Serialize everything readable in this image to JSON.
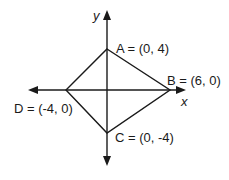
{
  "diagram": {
    "type": "coordinate-plane-quadrilateral",
    "axes": {
      "x_label": "x",
      "y_label": "y"
    },
    "vertices": [
      {
        "name": "A",
        "label": "A = (0, 4)",
        "x": 0,
        "y": 4
      },
      {
        "name": "B",
        "label": "B = (6, 0)",
        "x": 6,
        "y": 0
      },
      {
        "name": "C",
        "label": "C = (0, -4)",
        "x": 0,
        "y": -4
      },
      {
        "name": "D",
        "label": "D = (-4, 0)",
        "x": -4,
        "y": 0
      }
    ],
    "edges": [
      [
        "A",
        "B"
      ],
      [
        "B",
        "C"
      ],
      [
        "C",
        "D"
      ],
      [
        "D",
        "A"
      ]
    ],
    "line_color": "#1a1a1a"
  }
}
